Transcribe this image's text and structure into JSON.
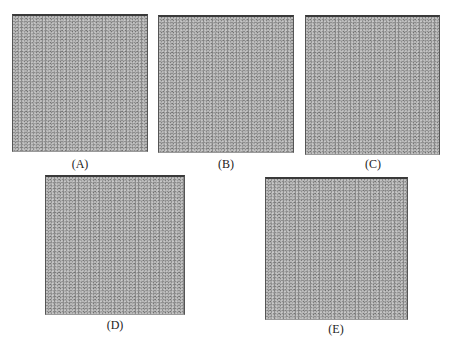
{
  "figure": {
    "panels": [
      {
        "id": "A",
        "label": "(A)",
        "description": "mottled gray granular texture"
      },
      {
        "id": "B",
        "label": "(B)",
        "description": "mottled gray granular texture"
      },
      {
        "id": "C",
        "label": "(C)",
        "description": "mottled gray granular texture"
      },
      {
        "id": "D",
        "label": "(D)",
        "description": "mottled gray granular texture"
      },
      {
        "id": "E",
        "label": "(E)",
        "description": "mottled gray granular texture"
      }
    ],
    "colors": {
      "texture_base": "#8e8e8e",
      "texture_light": "#dcdcdc",
      "border": "#3a3a3a",
      "background": "#ffffff",
      "label_text": "#222222"
    }
  }
}
